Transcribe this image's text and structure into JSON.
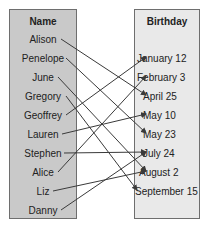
{
  "diagram": {
    "left_header": "Name",
    "right_header": "Birthday",
    "names": [
      "Alison",
      "Penelope",
      "June",
      "Gregory",
      "Geoffrey",
      "Lauren",
      "Stephen",
      "Alice",
      "Liz",
      "Danny"
    ],
    "birthdays": [
      "January 12",
      "February 3",
      "April 25",
      "May 10",
      "May 23",
      "July 24",
      "August 2",
      "September 15"
    ],
    "mappings": [
      {
        "from": "Alison",
        "to": "April 25"
      },
      {
        "from": "Penelope",
        "to": "May 23"
      },
      {
        "from": "June",
        "to": "August 2"
      },
      {
        "from": "Gregory",
        "to": "September 15"
      },
      {
        "from": "Geoffrey",
        "to": "January 12"
      },
      {
        "from": "Lauren",
        "to": "May 10"
      },
      {
        "from": "Stephen",
        "to": "July 24"
      },
      {
        "from": "Alice",
        "to": "February 3"
      },
      {
        "from": "Liz",
        "to": "August 2"
      },
      {
        "from": "Danny",
        "to": "July 24"
      }
    ],
    "colors": {
      "left_fill": "#c9c9c9",
      "right_fill": "#e9e9e9",
      "arrow": "#3a3a3a",
      "border": "#6e6e6e"
    }
  }
}
